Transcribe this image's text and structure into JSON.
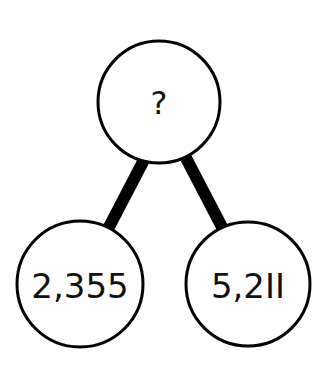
{
  "diagram": {
    "type": "number-bond",
    "whole": {
      "label": "?"
    },
    "parts": [
      {
        "label": "2,355"
      },
      {
        "label": "5,2II"
      }
    ],
    "colors": {
      "stroke": "#000000",
      "background": "#ffffff",
      "text": "#111111"
    }
  }
}
